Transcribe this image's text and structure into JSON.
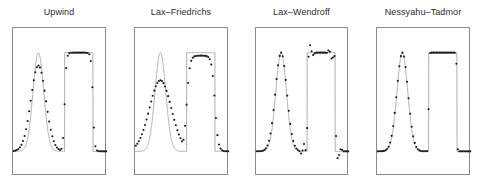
{
  "figure": {
    "background_color": "#ffffff",
    "axis_color": "#8a8a8a",
    "curve_color": "#9a9a9a",
    "marker_color": "#1a1a1a",
    "title_color": "#2b2b2b",
    "panel_count": 4
  },
  "panels": [
    {
      "id": "upwind",
      "title": "Upwind",
      "frame": {
        "x": 12,
        "y": 27,
        "width": 94,
        "height": 148
      }
    },
    {
      "id": "lax-friedrichs",
      "title": "Lax–Friedrichs",
      "frame": {
        "x": 134,
        "y": 27,
        "width": 94,
        "height": 148
      }
    },
    {
      "id": "lax-wendroff",
      "title": "Lax–Wendroff",
      "frame": {
        "x": 255,
        "y": 27,
        "width": 93,
        "height": 148
      }
    },
    {
      "id": "nessyahu-tadmor",
      "title": "Nessyahu–Tadmor",
      "frame": {
        "x": 376,
        "y": 27,
        "width": 94,
        "height": 148
      }
    }
  ],
  "chart_data": {
    "type": "line",
    "title": "",
    "subtitle": "",
    "xlabel": "",
    "ylabel": "",
    "xlim": [
      0,
      1
    ],
    "ylim": [
      -0.25,
      1.25
    ],
    "grid": false,
    "legend": "none",
    "axis_ticks_visible": false,
    "shared": {
      "exact_gaussian": {
        "center": 0.27,
        "height": 1.0,
        "halfwidth": 0.13
      },
      "exact_square": {
        "left": 0.55,
        "right": 0.85,
        "height": 1.0
      },
      "baseline": 0.0,
      "marker_count": 60
    },
    "panels": [
      {
        "name": "Upwind",
        "gaussian_peak_numeric": 0.87,
        "square_top_numeric": 1.0,
        "smearing": "moderate",
        "oscillation_amplitude": 0.0,
        "notes": "Peak clipped below exact; edges of square wave smeared over ~4 cells; no oscillations."
      },
      {
        "name": "Lax–Friedrichs",
        "gaussian_peak_numeric": 0.72,
        "square_top_numeric": 0.97,
        "smearing": "strong",
        "oscillation_amplitude": 0.0,
        "notes": "Most diffusive; peak strongly clipped; square wave edges smeared over ~8 cells; no oscillations."
      },
      {
        "name": "Lax–Wendroff",
        "gaussian_peak_numeric": 1.0,
        "square_top_numeric": 1.0,
        "smearing": "low",
        "oscillation_amplitude": 0.22,
        "notes": "Second order and dispersive; sharp profiles but overshoot dots above the square wave near its trailing edge and undershoot dots below the baseline ahead of its leading edge."
      },
      {
        "name": "Nessyahu–Tadmor",
        "gaussian_peak_numeric": 1.0,
        "square_top_numeric": 1.0,
        "smearing": "very low",
        "oscillation_amplitude": 0.0,
        "notes": "Second order non-oscillatory central scheme; sharpest resolution of both the pulse and the square wave with no spurious oscillations."
      }
    ]
  }
}
